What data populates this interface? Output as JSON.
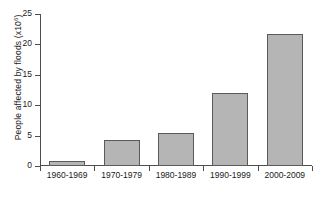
{
  "chart_data": {
    "type": "bar",
    "title": "",
    "xlabel": "",
    "ylabel": "People affected by floods (x10⁶)",
    "ylabel_base": "People affected by floods (x10",
    "ylabel_exponent": "6",
    "ylabel_close": ")",
    "categories": [
      "1960-1969",
      "1970-1979",
      "1980-1989",
      "1990-1999",
      "2000-2009"
    ],
    "values": [
      0.8,
      4.2,
      5.4,
      12.0,
      21.7
    ],
    "ylim": [
      0,
      25
    ],
    "yticks": [
      0,
      5,
      10,
      15,
      20,
      25
    ],
    "ytick_labels": [
      "0",
      "5",
      "10",
      "15",
      "20",
      "25"
    ],
    "grid": false,
    "legend": "none",
    "bar_color": "#b5b5b5",
    "bar_border_color": "#5a5a5a",
    "axis_color": "#4d4d4d"
  }
}
